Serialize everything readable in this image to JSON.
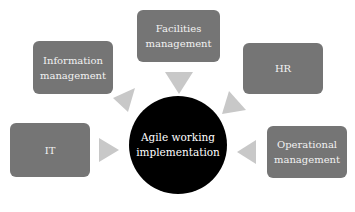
{
  "diagram": {
    "center": {
      "label_line1": "Agile working",
      "label_line2": "implementation"
    },
    "nodes": [
      {
        "id": "information",
        "line1": "Information",
        "line2": "management"
      },
      {
        "id": "facilities",
        "line1": "Facilities",
        "line2": "management"
      },
      {
        "id": "hr",
        "line1": "HR",
        "line2": ""
      },
      {
        "id": "it",
        "line1": "IT",
        "line2": ""
      },
      {
        "id": "operational",
        "line1": "Operational",
        "line2": "management"
      }
    ],
    "colors": {
      "box": "#757575",
      "center": "#000000",
      "arrow": "#c8c8c8",
      "background": "#ffffff"
    }
  }
}
